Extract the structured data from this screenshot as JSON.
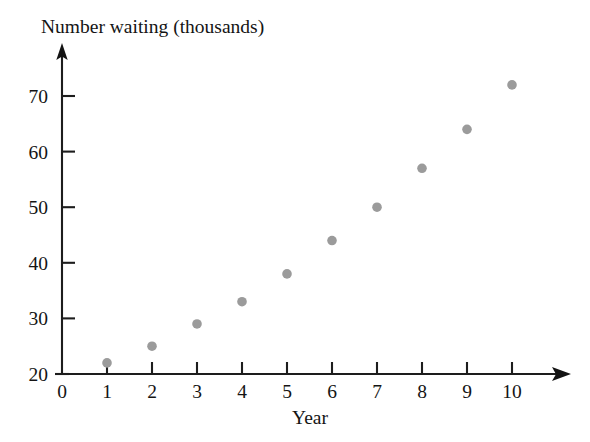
{
  "chart_data": {
    "type": "scatter",
    "title": "Number waiting (thousands)",
    "xlabel": "Year",
    "ylabel": "Number waiting (thousands)",
    "x": [
      1,
      2,
      3,
      4,
      5,
      6,
      7,
      8,
      9,
      10
    ],
    "values": [
      22,
      25,
      29,
      33,
      38,
      44,
      50,
      57,
      64,
      72
    ],
    "series": [
      {
        "name": "Number waiting",
        "values": [
          22,
          25,
          29,
          33,
          38,
          44,
          50,
          57,
          64,
          72
        ]
      }
    ],
    "points": [
      {
        "x": 1,
        "y": 22
      },
      {
        "x": 2,
        "y": 25
      },
      {
        "x": 3,
        "y": 29
      },
      {
        "x": 4,
        "y": 33
      },
      {
        "x": 5,
        "y": 38
      },
      {
        "x": 6,
        "y": 44
      },
      {
        "x": 7,
        "y": 50
      },
      {
        "x": 8,
        "y": 57
      },
      {
        "x": 9,
        "y": 64
      },
      {
        "x": 10,
        "y": 72
      }
    ],
    "xlim": [
      0,
      10
    ],
    "ylim": [
      20,
      75
    ],
    "x_ticks": [
      0,
      1,
      2,
      3,
      4,
      5,
      6,
      7,
      8,
      9,
      10
    ],
    "x_tick_labels": [
      "0",
      "1",
      "2",
      "3",
      "4",
      "5",
      "6",
      "7",
      "8",
      "9",
      "10"
    ],
    "y_ticks": [
      20,
      30,
      40,
      50,
      60,
      70
    ],
    "y_tick_labels": [
      "20",
      "30",
      "40",
      "50",
      "60",
      "70"
    ],
    "grid": false,
    "legend": false,
    "legend_position": "none",
    "marker_color": "#9b9b9b",
    "axis_color": "#1d1d1d",
    "background_color": "#ffffff",
    "x_axis_arrow": true,
    "y_axis_arrow": true
  },
  "labels": {
    "title": "Number waiting (thousands)",
    "x_axis_title": "Year"
  }
}
